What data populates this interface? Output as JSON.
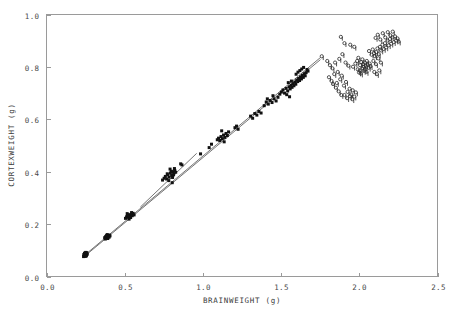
{
  "chart_data": {
    "type": "scatter",
    "title": "",
    "xlabel": "BRAINWEIGHT (g)",
    "ylabel": "CORTEXWEIGHT (g)",
    "xlim": [
      0.0,
      2.5
    ],
    "ylim": [
      0.0,
      1.0
    ],
    "xticks": [
      "0.0",
      "0.5",
      "1.0",
      "1.5",
      "2.0",
      "2.5"
    ],
    "xtick_values": [
      0.0,
      0.5,
      1.0,
      1.5,
      2.0,
      2.5
    ],
    "yticks": [
      "0.0",
      "0.2",
      "0.4",
      "0.6",
      "0.8",
      "1.0"
    ],
    "ytick_values": [
      0.0,
      0.2,
      0.4,
      0.6,
      0.8,
      1.0
    ],
    "grid": false,
    "legend": "none",
    "frame_color": "#9a9a9a",
    "marker_color": "#111111",
    "line_color": "#3a3a3a",
    "series": [
      {
        "name": "filled-points",
        "marker": "filled-square-dot",
        "points": [
          [
            0.237,
            0.076
          ],
          [
            0.241,
            0.079
          ],
          [
            0.244,
            0.081
          ],
          [
            0.246,
            0.084
          ],
          [
            0.248,
            0.077
          ],
          [
            0.25,
            0.082
          ],
          [
            0.252,
            0.086
          ],
          [
            0.254,
            0.08
          ],
          [
            0.243,
            0.088
          ],
          [
            0.256,
            0.083
          ],
          [
            0.247,
            0.09
          ],
          [
            0.258,
            0.087
          ],
          [
            0.239,
            0.084
          ],
          [
            0.251,
            0.092
          ],
          [
            0.26,
            0.085
          ],
          [
            0.245,
            0.086
          ],
          [
            0.253,
            0.078
          ],
          [
            0.249,
            0.089
          ],
          [
            0.257,
            0.091
          ],
          [
            0.242,
            0.082
          ],
          [
            0.372,
            0.148
          ],
          [
            0.378,
            0.151
          ],
          [
            0.382,
            0.146
          ],
          [
            0.386,
            0.154
          ],
          [
            0.39,
            0.149
          ],
          [
            0.394,
            0.157
          ],
          [
            0.398,
            0.152
          ],
          [
            0.402,
            0.158
          ],
          [
            0.376,
            0.143
          ],
          [
            0.388,
            0.16
          ],
          [
            0.406,
            0.155
          ],
          [
            0.392,
            0.145
          ],
          [
            0.384,
            0.156
          ],
          [
            0.4,
            0.15
          ],
          [
            0.38,
            0.153
          ],
          [
            0.505,
            0.222
          ],
          [
            0.512,
            0.228
          ],
          [
            0.518,
            0.233
          ],
          [
            0.524,
            0.226
          ],
          [
            0.53,
            0.236
          ],
          [
            0.536,
            0.23
          ],
          [
            0.542,
            0.238
          ],
          [
            0.548,
            0.232
          ],
          [
            0.554,
            0.241
          ],
          [
            0.56,
            0.235
          ],
          [
            0.516,
            0.24
          ],
          [
            0.528,
            0.219
          ],
          [
            0.544,
            0.244
          ],
          [
            0.522,
            0.231
          ],
          [
            0.538,
            0.225
          ],
          [
            0.742,
            0.368
          ],
          [
            0.752,
            0.375
          ],
          [
            0.76,
            0.382
          ],
          [
            0.768,
            0.372
          ],
          [
            0.776,
            0.388
          ],
          [
            0.784,
            0.379
          ],
          [
            0.792,
            0.395
          ],
          [
            0.8,
            0.386
          ],
          [
            0.808,
            0.4
          ],
          [
            0.814,
            0.392
          ],
          [
            0.82,
            0.405
          ],
          [
            0.826,
            0.398
          ],
          [
            0.79,
            0.41
          ],
          [
            0.804,
            0.358
          ],
          [
            0.812,
            0.388
          ],
          [
            0.798,
            0.402
          ],
          [
            0.772,
            0.392
          ],
          [
            0.782,
            0.366
          ],
          [
            0.818,
            0.412
          ],
          [
            0.806,
            0.378
          ],
          [
            0.858,
            0.43
          ],
          [
            0.866,
            0.426
          ],
          [
            0.985,
            0.468
          ],
          [
            1.04,
            0.492
          ],
          [
            1.055,
            0.505
          ],
          [
            1.092,
            0.522
          ],
          [
            1.1,
            0.528
          ],
          [
            1.108,
            0.519
          ],
          [
            1.116,
            0.534
          ],
          [
            1.124,
            0.526
          ],
          [
            1.132,
            0.54
          ],
          [
            1.14,
            0.531
          ],
          [
            1.148,
            0.546
          ],
          [
            1.156,
            0.538
          ],
          [
            1.164,
            0.552
          ],
          [
            1.12,
            0.556
          ],
          [
            1.136,
            0.514
          ],
          [
            1.205,
            0.568
          ],
          [
            1.215,
            0.574
          ],
          [
            1.225,
            0.562
          ],
          [
            1.305,
            0.612
          ],
          [
            1.318,
            0.604
          ],
          [
            1.332,
            0.622
          ],
          [
            1.345,
            0.616
          ],
          [
            1.358,
            0.63
          ],
          [
            1.372,
            0.624
          ],
          [
            1.392,
            0.652
          ],
          [
            1.405,
            0.666
          ],
          [
            1.418,
            0.658
          ],
          [
            1.43,
            0.672
          ],
          [
            1.442,
            0.664
          ],
          [
            1.455,
            0.678
          ],
          [
            1.468,
            0.67
          ],
          [
            1.48,
            0.684
          ],
          [
            1.448,
            0.69
          ],
          [
            1.412,
            0.678
          ],
          [
            1.492,
            0.696
          ],
          [
            1.502,
            0.704
          ],
          [
            1.512,
            0.712
          ],
          [
            1.522,
            0.7
          ],
          [
            1.532,
            0.718
          ],
          [
            1.542,
            0.708
          ],
          [
            1.552,
            0.724
          ],
          [
            1.558,
            0.716
          ],
          [
            1.564,
            0.73
          ],
          [
            1.57,
            0.722
          ],
          [
            1.576,
            0.736
          ],
          [
            1.582,
            0.728
          ],
          [
            1.546,
            0.74
          ],
          [
            1.536,
            0.694
          ],
          [
            1.566,
            0.746
          ],
          [
            1.554,
            0.686
          ],
          [
            1.588,
            0.742
          ],
          [
            1.594,
            0.734
          ],
          [
            1.6,
            0.75
          ],
          [
            1.606,
            0.744
          ],
          [
            1.612,
            0.756
          ],
          [
            1.618,
            0.748
          ],
          [
            1.624,
            0.762
          ],
          [
            1.63,
            0.754
          ],
          [
            1.636,
            0.768
          ],
          [
            1.642,
            0.76
          ],
          [
            1.648,
            0.774
          ],
          [
            1.654,
            0.766
          ],
          [
            1.608,
            0.78
          ],
          [
            1.62,
            0.786
          ],
          [
            1.632,
            0.792
          ],
          [
            1.644,
            0.798
          ],
          [
            1.596,
            0.772
          ],
          [
            1.66,
            0.778
          ],
          [
            1.666,
            0.79
          ],
          [
            1.672,
            0.784
          ]
        ]
      },
      {
        "name": "open-points",
        "marker": "open-circle-stem",
        "points": [
          [
            1.76,
            0.836
          ],
          [
            1.795,
            0.818
          ],
          [
            1.812,
            0.802
          ],
          [
            1.828,
            0.79
          ],
          [
            1.845,
            0.812
          ],
          [
            1.862,
            0.776
          ],
          [
            1.878,
            0.748
          ],
          [
            1.888,
            0.762
          ],
          [
            1.902,
            0.724
          ],
          [
            1.915,
            0.738
          ],
          [
            1.925,
            0.7
          ],
          [
            1.938,
            0.712
          ],
          [
            1.948,
            0.69
          ],
          [
            1.958,
            0.706
          ],
          [
            1.968,
            0.682
          ],
          [
            1.978,
            0.698
          ],
          [
            1.832,
            0.73
          ],
          [
            1.85,
            0.716
          ],
          [
            1.868,
            0.702
          ],
          [
            1.885,
            0.688
          ],
          [
            1.905,
            0.688
          ],
          [
            1.922,
            0.676
          ],
          [
            1.94,
            0.684
          ],
          [
            1.955,
            0.672
          ],
          [
            1.872,
            0.826
          ],
          [
            1.892,
            0.844
          ],
          [
            1.912,
            0.812
          ],
          [
            1.93,
            0.8
          ],
          [
            1.96,
            0.796
          ],
          [
            1.975,
            0.808
          ],
          [
            1.99,
            0.786
          ],
          [
            1.998,
            0.774
          ],
          [
            2.005,
            0.802
          ],
          [
            2.012,
            0.814
          ],
          [
            2.018,
            0.79
          ],
          [
            2.024,
            0.806
          ],
          [
            2.03,
            0.796
          ],
          [
            2.036,
            0.812
          ],
          [
            2.042,
            0.8
          ],
          [
            2.048,
            0.818
          ],
          [
            2.054,
            0.804
          ],
          [
            2.06,
            0.792
          ],
          [
            2.066,
            0.808
          ],
          [
            2.072,
            0.798
          ],
          [
            1.986,
            0.818
          ],
          [
            1.994,
            0.83
          ],
          [
            2.002,
            0.782
          ],
          [
            2.01,
            0.77
          ],
          [
            2.02,
            0.824
          ],
          [
            2.028,
            0.78
          ],
          [
            2.038,
            0.786
          ],
          [
            2.046,
            0.776
          ],
          [
            1.882,
            0.91
          ],
          [
            1.905,
            0.886
          ],
          [
            1.942,
            0.88
          ],
          [
            1.968,
            0.872
          ],
          [
            2.062,
            0.856
          ],
          [
            2.078,
            0.842
          ],
          [
            2.086,
            0.862
          ],
          [
            2.094,
            0.848
          ],
          [
            2.1,
            0.836
          ],
          [
            2.108,
            0.852
          ],
          [
            2.116,
            0.866
          ],
          [
            2.124,
            0.844
          ],
          [
            2.132,
            0.872
          ],
          [
            2.14,
            0.858
          ],
          [
            2.148,
            0.88
          ],
          [
            2.156,
            0.864
          ],
          [
            2.164,
            0.886
          ],
          [
            2.172,
            0.87
          ],
          [
            2.18,
            0.896
          ],
          [
            2.188,
            0.878
          ],
          [
            2.196,
            0.902
          ],
          [
            2.204,
            0.884
          ],
          [
            2.212,
            0.908
          ],
          [
            2.22,
            0.89
          ],
          [
            2.228,
            0.912
          ],
          [
            2.236,
            0.896
          ],
          [
            2.244,
            0.904
          ],
          [
            2.252,
            0.892
          ],
          [
            2.104,
            0.906
          ],
          [
            2.118,
            0.918
          ],
          [
            2.134,
            0.9
          ],
          [
            2.15,
            0.924
          ],
          [
            2.166,
            0.908
          ],
          [
            2.182,
            0.928
          ],
          [
            2.198,
            0.916
          ],
          [
            2.214,
            0.93
          ],
          [
            2.09,
            0.818
          ],
          [
            2.106,
            0.806
          ],
          [
            2.122,
            0.828
          ],
          [
            2.138,
            0.812
          ],
          [
            2.096,
            0.776
          ],
          [
            2.112,
            0.768
          ],
          [
            2.128,
            0.782
          ],
          [
            1.806,
            0.756
          ],
          [
            1.822,
            0.742
          ],
          [
            1.84,
            0.768
          ],
          [
            1.856,
            0.734
          ]
        ]
      }
    ],
    "fit_lines": [
      {
        "name": "regression-line-1",
        "x": [
          0.245,
          1.752
        ],
        "y": [
          0.082,
          0.836
        ]
      },
      {
        "name": "regression-line-2",
        "x": [
          0.245,
          1.752
        ],
        "y": [
          0.078,
          0.828
        ]
      },
      {
        "name": "regression-line-3",
        "x": [
          0.6,
          0.96
        ],
        "y": [
          0.265,
          0.47
        ]
      }
    ]
  },
  "figure": {
    "background": "#ffffff",
    "width": 456,
    "height": 315
  }
}
